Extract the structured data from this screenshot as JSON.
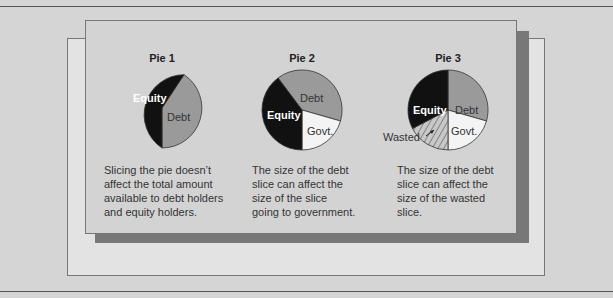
{
  "colors": {
    "background": "#d5d5d5",
    "panel": "#d3d3d3",
    "back_panel": "#e3e3e3",
    "shadow": "#787878",
    "equity": "#111111",
    "debt": "#9a9a9a",
    "government": "#f4f4f4",
    "wasted": "#c4c4c4"
  },
  "pies": [
    {
      "title": "Pie 1",
      "slices": [
        {
          "name": "Equity",
          "label": "Equity"
        },
        {
          "name": "Debt",
          "label": "Debt"
        }
      ],
      "caption": "Slicing the pie doesn’t\naffect the total amount\navailable to debt holders\nand equity holders."
    },
    {
      "title": "Pie 2",
      "slices": [
        {
          "name": "Debt",
          "label": "Debt"
        },
        {
          "name": "Equity",
          "label": "Equity"
        },
        {
          "name": "Government",
          "label": "Govt."
        }
      ],
      "caption": "The size of the debt\nslice can affect the\nsize of the slice\ngoing to government."
    },
    {
      "title": "Pie 3",
      "slices": [
        {
          "name": "Equity",
          "label": "Equity"
        },
        {
          "name": "Debt",
          "label": "Debt"
        },
        {
          "name": "Government",
          "label": "Govt."
        },
        {
          "name": "Wasted",
          "label": "Wasted"
        }
      ],
      "caption": "The size of the debt\nslice can affect the\nsize of the wasted\nslice."
    }
  ]
}
